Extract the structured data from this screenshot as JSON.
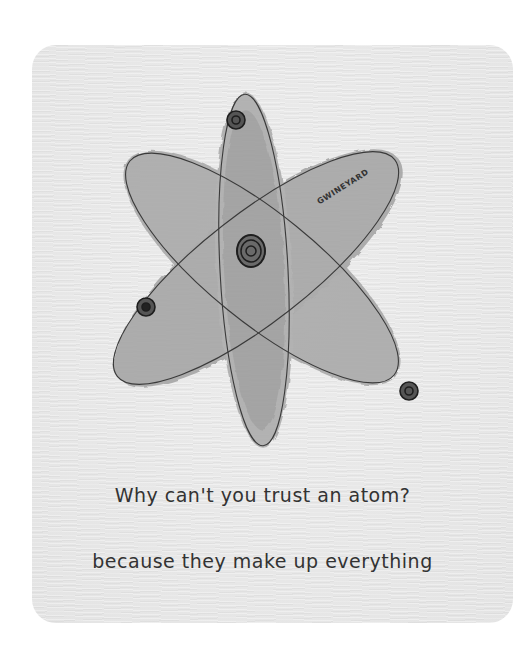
{
  "artwork": {
    "subject": "atom-watercolor-sketch",
    "signature": "GWINEYARD",
    "colors": {
      "paper": "#e9e9e9",
      "wash": "#a9a9a9",
      "wash_dark": "#8f8f8f",
      "ink": "#2a2a2a",
      "background": "#ffffff"
    }
  },
  "caption": {
    "line1": "Why can't you trust an atom?",
    "line2": "because they make up everything"
  }
}
